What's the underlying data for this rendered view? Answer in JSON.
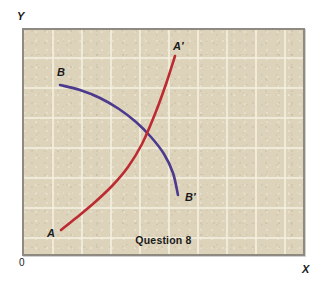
{
  "figure": {
    "caption": "Question 8",
    "origin_label": "0",
    "x_axis_label": "X",
    "y_axis_label": "Y",
    "background_color": "#ddd3ba",
    "frame_color": "#8e8a82",
    "grid_color": "#f5f0e2"
  },
  "labels": {
    "a": "A",
    "a_prime": "A′",
    "b": "B",
    "b_prime": "B′"
  },
  "chart_data": {
    "type": "line",
    "title": "Question 8",
    "xlabel": "X",
    "ylabel": "Y",
    "grid": true,
    "legend": "none",
    "xlim": [
      0,
      283
    ],
    "ylim": [
      0,
      228
    ],
    "note": "Two crossing curves on a gridded tan field: an upward-sloping red curve A to A-prime and a downward-sloping purple curve B to B-prime, intersecting near the middle of the plot.",
    "grid_lines": {
      "vertical_x": [
        29,
        58,
        87,
        116,
        145,
        174,
        203,
        232,
        261
      ],
      "horizontal_y": [
        28,
        58,
        88,
        118,
        148,
        178,
        208
      ]
    },
    "series": [
      {
        "name": "A to A′",
        "color": "#bd2b32",
        "start_label": "A",
        "end_label": "A′",
        "path_points": [
          [
            37,
            200
          ],
          [
            52,
            188
          ],
          [
            70,
            173
          ],
          [
            88,
            156
          ],
          [
            104,
            137
          ],
          [
            118,
            114
          ],
          [
            131,
            84
          ],
          [
            142,
            54
          ],
          [
            151,
            26
          ]
        ]
      },
      {
        "name": "B to B′",
        "color": "#4b3a8e",
        "start_label": "B",
        "end_label": "B′",
        "path_points": [
          [
            36,
            55
          ],
          [
            56,
            60
          ],
          [
            76,
            68
          ],
          [
            95,
            79
          ],
          [
            112,
            92
          ],
          [
            127,
            107
          ],
          [
            140,
            124
          ],
          [
            149,
            143
          ],
          [
            154,
            165
          ]
        ]
      }
    ],
    "intersection": [
      113,
      99
    ]
  }
}
